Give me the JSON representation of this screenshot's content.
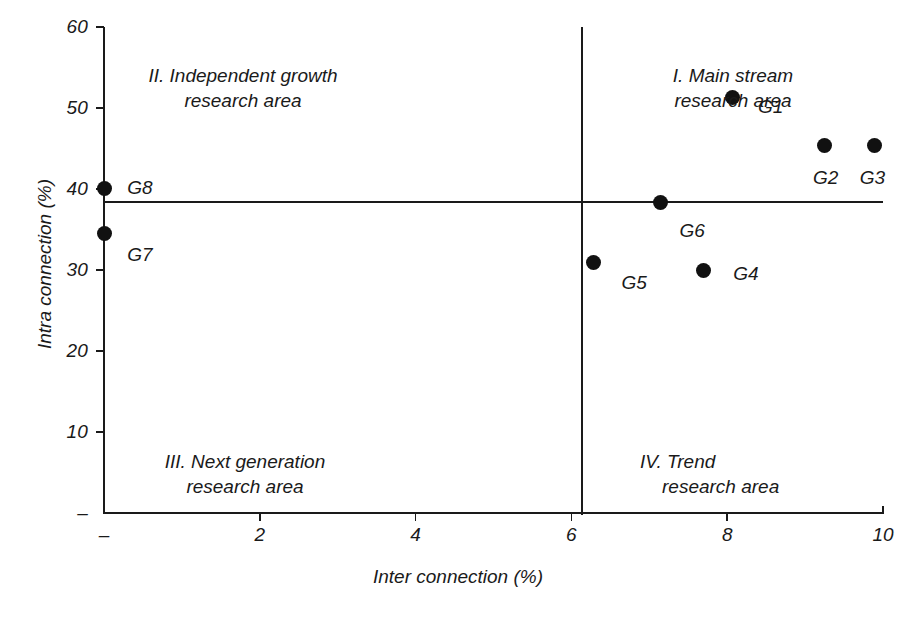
{
  "chart_data": {
    "type": "scatter",
    "title": "",
    "xlabel": "Inter connection (%)",
    "ylabel": "Intra connection (%)",
    "xlim": [
      0,
      10
    ],
    "ylim": [
      0,
      60
    ],
    "grid": false,
    "legend": "none",
    "x_ticks": [
      {
        "value": 0,
        "label": "–"
      },
      {
        "value": 2,
        "label": "2"
      },
      {
        "value": 4,
        "label": "4"
      },
      {
        "value": 6,
        "label": "6"
      },
      {
        "value": 8,
        "label": "8"
      },
      {
        "value": 10,
        "label": "10"
      }
    ],
    "y_ticks": [
      {
        "value": 60,
        "label": "60"
      },
      {
        "value": 50,
        "label": "50"
      },
      {
        "value": 40,
        "label": "40"
      },
      {
        "value": 30,
        "label": "30"
      },
      {
        "value": 20,
        "label": "20"
      },
      {
        "value": 10,
        "label": "10"
      },
      {
        "value": 0,
        "label": "–"
      }
    ],
    "reference_lines": {
      "vertical_x": 6.1,
      "horizontal_y": 38.4
    },
    "points": [
      {
        "name": "G1",
        "x": 8.07,
        "y": 51.3,
        "label_dx": 38,
        "label_dy": 10
      },
      {
        "name": "G2",
        "x": 9.25,
        "y": 45.4,
        "label_dx": 1,
        "label_dy": 33
      },
      {
        "name": "G3",
        "x": 9.89,
        "y": 45.4,
        "label_dx": -2,
        "label_dy": 33
      },
      {
        "name": "G4",
        "x": 7.7,
        "y": 29.9,
        "label_dx": 42,
        "label_dy": 3
      },
      {
        "name": "G5",
        "x": 6.28,
        "y": 30.9,
        "label_dx": 41,
        "label_dy": 20
      },
      {
        "name": "G6",
        "x": 7.14,
        "y": 38.3,
        "label_dx": 32,
        "label_dy": 28
      },
      {
        "name": "G7",
        "x": 0.0,
        "y": 34.5,
        "label_dx": 36,
        "label_dy": 21
      },
      {
        "name": "G8",
        "x": 0.0,
        "y": 40.1,
        "label_dx": 36,
        "label_dy": 0
      }
    ],
    "quadrants": [
      {
        "id": "I",
        "line1": "I. Main stream",
        "line2": "research area"
      },
      {
        "id": "II",
        "line1": "II. Independent growth",
        "line2": "research area"
      },
      {
        "id": "III",
        "line1": "III. Next generation",
        "line2": "research area"
      },
      {
        "id": "IV",
        "line1": "IV. Trend",
        "line2": "research area"
      }
    ],
    "colors": {
      "point": "#111111",
      "axis": "#1a1a1a",
      "background": "#ffffff"
    }
  }
}
